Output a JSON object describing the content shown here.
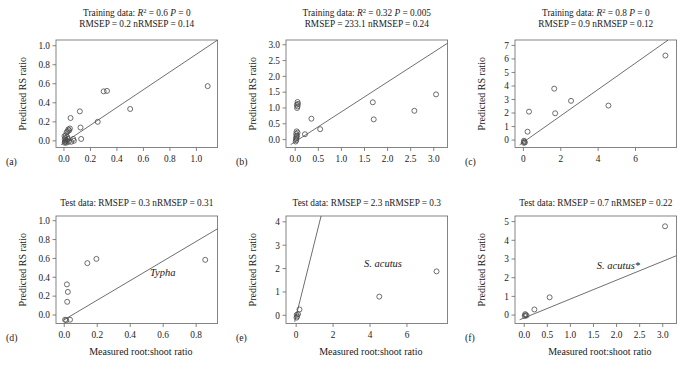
{
  "figure": {
    "axis_labels": {
      "y": "Predicted RS ratio",
      "x": "Measured root:shoot ratio"
    },
    "marker": "open-circle",
    "line_color": "#555555",
    "axis_color": "#666666",
    "text_color": "#1a1a1a"
  },
  "chart_data": [
    {
      "type": "scatter",
      "panel": "(a)",
      "title_line1": "Training data: R² = 0.6 P = 0",
      "title_line2": "RMSEP = 0.2 nRMSEP = 0.14",
      "title_tokens": {
        "prefix": "Training data:",
        "r2_label": "R",
        "r2_sup": "2",
        "r2_value": "= 0.6",
        "p_label": "P",
        "p_value": "= 0",
        "rmsep": "RMSEP = 0.2 nRMSEP = 0.14"
      },
      "annotation": "",
      "xlabel": "",
      "ylabel": "Predicted RS ratio",
      "xlim": [
        -0.06,
        1.16
      ],
      "ylim": [
        -0.07,
        1.06
      ],
      "xticks": [
        0.0,
        0.2,
        0.4,
        0.6,
        0.8,
        1.0
      ],
      "xticklabels": [
        "0.0",
        "0.2",
        "0.4",
        "0.6",
        "0.8",
        "1.0"
      ],
      "yticks": [
        0.0,
        0.2,
        0.4,
        0.6,
        0.8,
        1.0
      ],
      "yticklabels": [
        "0.0",
        "0.2",
        "0.4",
        "0.6",
        "0.8",
        "1.0"
      ],
      "grid": false,
      "line": {
        "x0": -0.02,
        "y0": -0.04,
        "x1": 1.16,
        "y1": 1.06
      },
      "points": [
        [
          0.005,
          -0.02
        ],
        [
          0.008,
          -0.01
        ],
        [
          0.012,
          0.0
        ],
        [
          0.006,
          0.015
        ],
        [
          0.01,
          0.03
        ],
        [
          0.018,
          -0.02
        ],
        [
          0.022,
          0.0
        ],
        [
          0.004,
          0.05
        ],
        [
          0.015,
          0.06
        ],
        [
          0.025,
          0.04
        ],
        [
          0.03,
          0.02
        ],
        [
          0.035,
          -0.01
        ],
        [
          0.02,
          0.09
        ],
        [
          0.028,
          0.1
        ],
        [
          0.033,
          0.12
        ],
        [
          0.04,
          0.11
        ],
        [
          0.045,
          0.13
        ],
        [
          0.05,
          0.24
        ],
        [
          0.055,
          -0.01
        ],
        [
          0.07,
          0.02
        ],
        [
          0.075,
          0.0
        ],
        [
          0.12,
          0.31
        ],
        [
          0.125,
          0.14
        ],
        [
          0.13,
          0.02
        ],
        [
          0.255,
          0.2
        ],
        [
          0.3,
          0.52
        ],
        [
          0.325,
          0.525
        ],
        [
          0.5,
          0.335
        ],
        [
          1.085,
          0.575
        ]
      ]
    },
    {
      "type": "scatter",
      "panel": "(b)",
      "title_line1": "Training data: R² = 0.32 P = 0.005",
      "title_line2": "RMSEP = 233.1 nRMSEP = 0.24",
      "title_tokens": {
        "prefix": "Training data:",
        "r2_label": "R",
        "r2_sup": "2",
        "r2_value": "= 0.32",
        "p_label": "P",
        "p_value": "= 0.005",
        "rmsep": "RMSEP = 233.1 nRMSEP = 0.24"
      },
      "annotation": "",
      "xlabel": "",
      "ylabel": "Predicted RS ratio",
      "xlim": [
        -0.2,
        3.3
      ],
      "ylim": [
        -0.25,
        3.15
      ],
      "xticks": [
        0.0,
        0.5,
        1.0,
        1.5,
        2.0,
        2.5,
        3.0
      ],
      "xticklabels": [
        "0.0",
        "0.5",
        "1.0",
        "1.5",
        "2.0",
        "2.5",
        "3.0"
      ],
      "yticks": [
        0.0,
        0.5,
        1.0,
        1.5,
        2.0,
        2.5,
        3.0
      ],
      "yticklabels": [
        "0.0",
        "0.5",
        "1.0",
        "1.5",
        "2.0",
        "2.5",
        "3.0"
      ],
      "grid": false,
      "line": {
        "x0": -0.1,
        "y0": -0.16,
        "x1": 3.3,
        "y1": 3.05
      },
      "points": [
        [
          0.01,
          -0.06
        ],
        [
          0.02,
          -0.02
        ],
        [
          0.015,
          0.03
        ],
        [
          0.03,
          0.05
        ],
        [
          0.025,
          0.1
        ],
        [
          0.04,
          0.13
        ],
        [
          0.02,
          0.18
        ],
        [
          0.05,
          0.22
        ],
        [
          0.03,
          0.26
        ],
        [
          0.04,
          1.0
        ],
        [
          0.05,
          1.05
        ],
        [
          0.035,
          1.1
        ],
        [
          0.06,
          1.13
        ],
        [
          0.05,
          1.19
        ],
        [
          0.21,
          0.17
        ],
        [
          0.35,
          0.66
        ],
        [
          0.54,
          0.33
        ],
        [
          1.68,
          1.18
        ],
        [
          1.7,
          0.64
        ],
        [
          2.58,
          0.91
        ],
        [
          3.05,
          1.43
        ]
      ]
    },
    {
      "type": "scatter",
      "panel": "(c)",
      "title_line1": "Training data: R² = 0.8 P = 0",
      "title_line2": "RMSEP = 0.9 nRMSEP = 0.12",
      "title_tokens": {
        "prefix": "Training data:",
        "r2_label": "R",
        "r2_sup": "2",
        "r2_value": "= 0.8",
        "p_label": "P",
        "p_value": "= 0",
        "rmsep": "RMSEP = 0.9 nRMSEP = 0.12"
      },
      "annotation": "",
      "xlabel": "",
      "ylabel": "Predicted RS ratio",
      "xlim": [
        -0.45,
        8.2
      ],
      "ylim": [
        -0.55,
        7.4
      ],
      "xticks": [
        0,
        2,
        4,
        6
      ],
      "xticklabels": [
        "0",
        "2",
        "4",
        "6"
      ],
      "yticks": [
        0,
        1,
        2,
        3,
        4,
        5,
        6,
        7
      ],
      "yticklabels": [
        "0",
        "1",
        "2",
        "3",
        "4",
        "5",
        "6",
        "7"
      ],
      "grid": false,
      "line": {
        "x0": -0.2,
        "y0": -0.35,
        "x1": 7.75,
        "y1": 7.4
      },
      "points": [
        [
          0.02,
          -0.2
        ],
        [
          0.05,
          -0.12
        ],
        [
          0.03,
          -0.05
        ],
        [
          0.08,
          -0.18
        ],
        [
          0.22,
          0.62
        ],
        [
          0.3,
          2.1
        ],
        [
          1.65,
          3.8
        ],
        [
          1.7,
          1.98
        ],
        [
          2.55,
          2.9
        ],
        [
          4.55,
          2.55
        ],
        [
          7.6,
          6.25
        ]
      ]
    },
    {
      "type": "scatter",
      "panel": "(d)",
      "title_line1": "Test data: RMSEP = 0.3 nRMSEP = 0.31",
      "title_line2": "",
      "title_tokens": {
        "prefix": "Test data:",
        "rmsep": "RMSEP = 0.3 nRMSEP = 0.31"
      },
      "annotation": "Typha",
      "annotation_style": "italic",
      "xlabel": "Measured root:shoot ratio",
      "ylabel": "Predicted RS ratio",
      "xlim": [
        -0.05,
        0.93
      ],
      "ylim": [
        -0.09,
        1.05
      ],
      "xticks": [
        0.0,
        0.2,
        0.4,
        0.6,
        0.8
      ],
      "xticklabels": [
        "0.0",
        "0.2",
        "0.4",
        "0.6",
        "0.8"
      ],
      "yticks": [
        0.0,
        0.2,
        0.4,
        0.6,
        0.8,
        1.0
      ],
      "yticklabels": [
        "0.0",
        "0.2",
        "0.4",
        "0.6",
        "0.8",
        "1.0"
      ],
      "grid": false,
      "line": {
        "x0": -0.005,
        "y0": -0.055,
        "x1": 0.93,
        "y1": 0.915
      },
      "points": [
        [
          0.005,
          -0.05
        ],
        [
          0.012,
          -0.055
        ],
        [
          0.035,
          -0.05
        ],
        [
          0.018,
          0.14
        ],
        [
          0.022,
          0.245
        ],
        [
          0.016,
          0.325
        ],
        [
          0.14,
          0.55
        ],
        [
          0.195,
          0.595
        ],
        [
          0.855,
          0.585
        ]
      ]
    },
    {
      "type": "scatter",
      "panel": "(e)",
      "title_line1": "Test data: RMSEP = 2.3 nRMSEP = 0.3",
      "title_line2": "",
      "title_tokens": {
        "prefix": "Test data:",
        "rmsep": "RMSEP = 2.3 nRMSEP = 0.3"
      },
      "annotation": "S. acutus",
      "annotation_style": "italic",
      "xlabel": "Measured root:shoot ratio",
      "ylabel": "Predicted RS ratio",
      "xlim": [
        -0.55,
        8.2
      ],
      "ylim": [
        -0.35,
        4.25
      ],
      "xticks": [
        0,
        2,
        4,
        6
      ],
      "xticklabels": [
        "0",
        "2",
        "4",
        "6"
      ],
      "yticks": [
        0,
        1,
        2,
        3,
        4
      ],
      "yticklabels": [
        "0",
        "1",
        "2",
        "3",
        "4"
      ],
      "grid": false,
      "line": {
        "x0": -0.08,
        "y0": -0.28,
        "x1": 1.35,
        "y1": 4.25
      },
      "points": [
        [
          0.02,
          -0.1
        ],
        [
          0.05,
          -0.05
        ],
        [
          0.03,
          0.02
        ],
        [
          0.1,
          0.05
        ],
        [
          0.18,
          0.25
        ],
        [
          4.5,
          0.8
        ],
        [
          7.6,
          1.88
        ]
      ]
    },
    {
      "type": "scatter",
      "panel": "(f)",
      "title_line1": "Test data: RMSEP = 0.7 nRMSEP = 0.22",
      "title_line2": "",
      "title_tokens": {
        "prefix": "Test data:",
        "rmsep": "RMSEP = 0.7 nRMSEP = 0.22"
      },
      "annotation": "S. acutus*",
      "annotation_style": "italic",
      "xlabel": "Measured root:shoot ratio",
      "ylabel": "Predicted RS ratio",
      "xlim": [
        -0.2,
        3.3
      ],
      "ylim": [
        -0.45,
        5.3
      ],
      "xticks": [
        0.0,
        0.5,
        1.0,
        1.5,
        2.0,
        2.5,
        3.0
      ],
      "xticklabels": [
        "0.0",
        "0.5",
        "1.0",
        "1.5",
        "2.0",
        "2.5",
        "3.0"
      ],
      "yticks": [
        0,
        1,
        2,
        3,
        4,
        5
      ],
      "yticklabels": [
        "0",
        "1",
        "2",
        "3",
        "4",
        "5"
      ],
      "grid": false,
      "line": {
        "x0": -0.1,
        "y0": -0.25,
        "x1": 3.3,
        "y1": 3.18
      },
      "points": [
        [
          0.01,
          -0.05
        ],
        [
          0.03,
          0.0
        ],
        [
          0.02,
          0.05
        ],
        [
          0.05,
          -0.02
        ],
        [
          0.22,
          0.3
        ],
        [
          0.55,
          0.95
        ],
        [
          3.05,
          4.75
        ]
      ]
    }
  ]
}
